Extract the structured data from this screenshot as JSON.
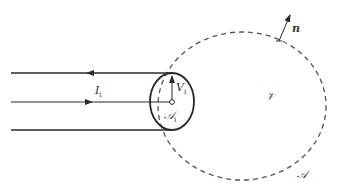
{
  "diagram": {
    "labels": {
      "normal": "n",
      "current": "I",
      "current_sub": "i",
      "potential": "V",
      "potential_sub": "i",
      "port_area": "𝒜",
      "port_area_sub": "i",
      "volume": "𝒱",
      "surface": "𝒜"
    },
    "elements": [
      {
        "id": "outer-conductor-top",
        "kind": "line",
        "arrow": "left"
      },
      {
        "id": "inner-conductor",
        "kind": "line",
        "arrow": "right"
      },
      {
        "id": "outer-conductor-bottom",
        "kind": "line",
        "arrow": "none"
      },
      {
        "id": "port-cross-section",
        "kind": "ellipse",
        "style": "solid"
      },
      {
        "id": "bounding-surface",
        "kind": "ellipse",
        "style": "dashed"
      },
      {
        "id": "normal-vector",
        "kind": "arrow"
      },
      {
        "id": "voltage-arrow",
        "kind": "arrow"
      }
    ],
    "colors": {
      "stroke": "#2a2a2a",
      "dashed": "#555555",
      "text": "#333333"
    }
  }
}
